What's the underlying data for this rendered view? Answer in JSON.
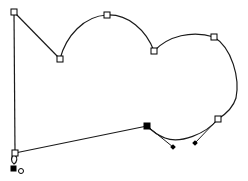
{
  "canvas": {
    "background": "#ffffff",
    "stroke_color": "#1a1a1a"
  },
  "path": {
    "description": "Open bezier path in node-edit mode",
    "selected_node_index": 6,
    "nodes": [
      {
        "id": "n0",
        "type": "corner",
        "selected": false
      },
      {
        "id": "n1",
        "type": "corner",
        "selected": false
      },
      {
        "id": "n2",
        "type": "smooth",
        "selected": false
      },
      {
        "id": "n3",
        "type": "cusp",
        "selected": false
      },
      {
        "id": "n4",
        "type": "smooth",
        "selected": false
      },
      {
        "id": "n5",
        "type": "smooth",
        "selected": false
      },
      {
        "id": "n6",
        "type": "smooth",
        "selected": true
      },
      {
        "id": "n7",
        "type": "corner",
        "selected": false
      }
    ]
  },
  "markers": {
    "start_marker": "filled-square",
    "end_marker": "open-circle"
  }
}
